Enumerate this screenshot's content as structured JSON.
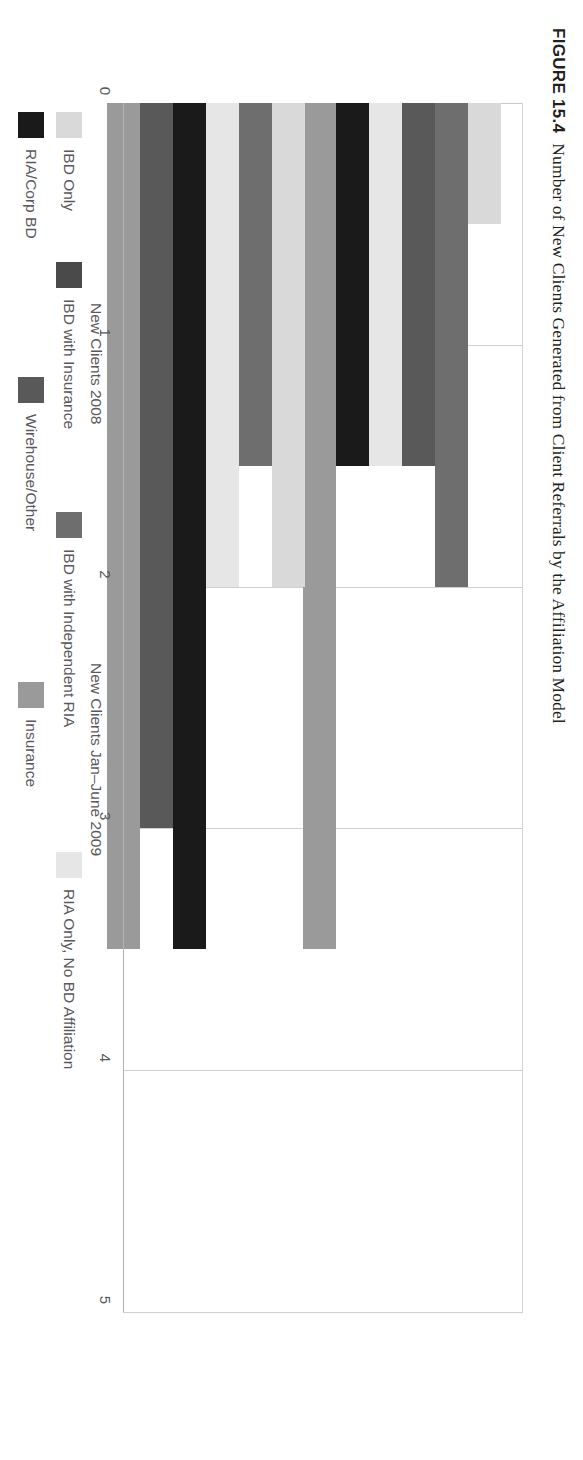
{
  "figure": {
    "number": "FIGURE 15.4",
    "caption": "Number of New Clients Generated from Client Referrals by the Affiliation Model"
  },
  "chart_data": {
    "type": "bar",
    "orientation": "vertical",
    "title": "Number of New Clients Generated from Client Referrals by the Affiliation Model",
    "xlabel": "",
    "ylabel": "",
    "ylim": [
      0,
      5
    ],
    "yticks": [
      "0",
      "1",
      "2",
      "3",
      "4",
      "5"
    ],
    "grid": true,
    "legend_position": "bottom",
    "categories": [
      "New Clients 2008",
      "New Clients Jan–June 2009"
    ],
    "series": [
      {
        "name": "IBD Only",
        "color": "#d9d9d9",
        "values": [
          2.0,
          0.5
        ]
      },
      {
        "name": "IBD with Insurance",
        "color": "#4a4a4a",
        "values": [
          4.0,
          1.5
        ]
      },
      {
        "name": "IBD with Independent RIA",
        "color": "#6e6e6e",
        "values": [
          1.5,
          2.0
        ]
      },
      {
        "name": "RIA Only, No BD Affiliation",
        "color": "#e6e6e6",
        "values": [
          2.0,
          1.5
        ]
      },
      {
        "name": "RIA/Corp BD",
        "color": "#1a1a1a",
        "values": [
          3.5,
          1.5
        ]
      },
      {
        "name": "Wirehouse/Other",
        "color": "#595959",
        "values": [
          3.0,
          1.5
        ]
      },
      {
        "name": "Insurance",
        "color": "#9a9a9a",
        "values": [
          3.5,
          3.5
        ]
      }
    ]
  },
  "axis": {
    "ticks": [
      {
        "value": 5,
        "label": "5"
      },
      {
        "value": 4,
        "label": "4"
      },
      {
        "value": 3,
        "label": "3"
      },
      {
        "value": 2,
        "label": "2"
      },
      {
        "value": 1,
        "label": "1"
      },
      {
        "value": 0,
        "label": "0"
      }
    ]
  },
  "groups": [
    {
      "id": "g2008",
      "label": "New Clients 2008"
    },
    {
      "id": "g2009",
      "label": "New Clients Jan–June 2009"
    }
  ],
  "legend": {
    "rows": [
      [
        {
          "label": "IBD Only",
          "color": "#d9d9d9",
          "swatch": "legend-swatch-ibd-only"
        },
        {
          "label": "IBD with Insurance",
          "color": "#4a4a4a",
          "swatch": "legend-swatch-ibd-insurance"
        },
        {
          "label": "IBD with Independent RIA",
          "color": "#6e6e6e",
          "swatch": "legend-swatch-ibd-ria"
        },
        {
          "label": "RIA Only, No BD Affiliation",
          "color": "#e6e6e6",
          "swatch": "legend-swatch-ria-only"
        }
      ],
      [
        {
          "label": "RIA/Corp BD",
          "color": "#1a1a1a",
          "swatch": "legend-swatch-ria-corp-bd"
        },
        {
          "label": "Wirehouse/Other",
          "color": "#595959",
          "swatch": "legend-swatch-wirehouse"
        },
        {
          "label": "Insurance",
          "color": "#9a9a9a",
          "swatch": "legend-swatch-insurance"
        }
      ]
    ]
  },
  "bar_layout": {
    "group_order_2009": [
      "IBD Only",
      "IBD with Independent RIA",
      "Wirehouse/Other",
      "RIA Only, No BD Affiliation",
      "RIA/Corp BD",
      "Insurance"
    ],
    "group_order_2008": [
      "IBD Only",
      "IBD with Independent RIA",
      "RIA Only, No BD Affiliation",
      "RIA/Corp BD",
      "Wirehouse/Other",
      "Insurance"
    ]
  }
}
